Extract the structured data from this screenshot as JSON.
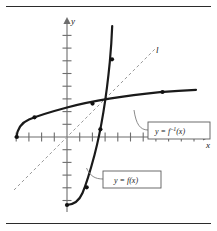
{
  "figure": {
    "kind": "math-graph",
    "background_color": "#ffffff",
    "rules": {
      "top_label": "top-horizontal-rule",
      "bottom_label": "bottom-horizontal-rule",
      "color": "#2b2b2b"
    },
    "axes": {
      "x_label": "x",
      "y_label": "y",
      "color": "#6d6d6d",
      "origin_px": [
        67,
        137
      ],
      "unit_px": 12.7,
      "x_tick_count_left": 4,
      "x_tick_count_right": 11,
      "y_tick_count_up": 9,
      "y_tick_count_down": 6
    },
    "identity_line": {
      "label": "l",
      "equation": "y = x",
      "style": "dashed",
      "color": "#9a9a9a"
    },
    "callouts": [
      {
        "name": "inverse-function-callout",
        "text_prefix": "y = f",
        "text_exponent": "–1",
        "text_suffix": "(x)",
        "full_text": "y = f –1(x)",
        "box_px": [
          148,
          112,
          62,
          17
        ]
      },
      {
        "name": "function-callout",
        "text": "y = f(x)",
        "box_px": [
          103,
          161,
          58,
          17
        ]
      }
    ],
    "curves": [
      {
        "name": "f-curve",
        "label": "y = f(x)",
        "description": "steep exponential-like increasing curve",
        "color": "#1a1a1a",
        "marked_points": [
          [
            -2,
            -3
          ],
          [
            -1,
            -2.6
          ],
          [
            0.5,
            -0.6
          ],
          [
            1.4,
            2.8
          ]
        ]
      },
      {
        "name": "f-inverse-curve",
        "label": "y = f–1(x)",
        "description": "logarithmic-like increasing curve, reflection of f across l",
        "color": "#1a1a1a",
        "marked_points": [
          [
            -3,
            -2
          ],
          [
            -2.6,
            -1
          ],
          [
            -0.6,
            0.5
          ],
          [
            2.8,
            1.4
          ]
        ]
      }
    ]
  }
}
